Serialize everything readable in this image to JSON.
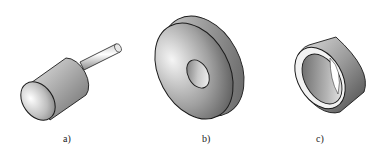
{
  "figure": {
    "panels": [
      {
        "id": "a",
        "label": "a)",
        "shape": "mounted-point-cylinder-with-shank"
      },
      {
        "id": "b",
        "label": "b)",
        "shape": "flat-disc-wheel-with-center-hole"
      },
      {
        "id": "c",
        "label": "c)",
        "shape": "cup-ring-wheel"
      }
    ],
    "colors": {
      "background": "#ffffff",
      "outline": "#1a1a1a",
      "shade_light": "#f2f2f2",
      "shade_mid": "#b0b0b0",
      "shade_dark": "#555555"
    }
  }
}
